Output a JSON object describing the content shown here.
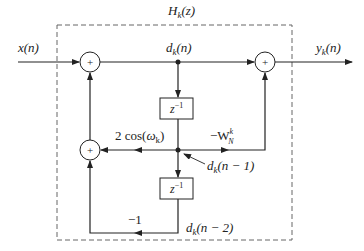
{
  "diagram": {
    "title": "H",
    "title_sub": "k",
    "title_arg": "(z)",
    "input_label": "x(n)",
    "output_label": {
      "main": "y",
      "sub": "k",
      "arg": "(n)"
    },
    "node_dk_n": {
      "main": "d",
      "sub": "k",
      "arg": "(n)"
    },
    "node_dk_n1": {
      "main": "d",
      "sub": "k",
      "arg": "(n − 1)"
    },
    "node_dk_n2": {
      "main": "d",
      "sub": "k",
      "arg": "(n − 2)"
    },
    "delay_label": "z",
    "delay_exp": "−1",
    "adder_symbol": "+",
    "gain_cos": {
      "prefix": "2 cos(",
      "omega": "ω",
      "sub": "k",
      "suffix": ")"
    },
    "gain_w": {
      "prefix": "−W",
      "sub": "N",
      "sup": "k"
    },
    "gain_minus_one": "−1",
    "colors": {
      "line": "#222222",
      "dash": "#666666",
      "background": "#ffffff"
    }
  }
}
